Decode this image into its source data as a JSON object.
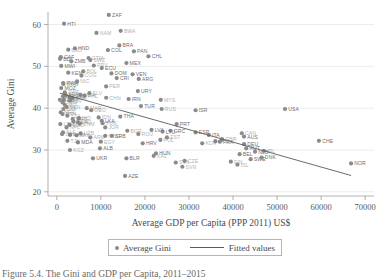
{
  "figure": {
    "caption": "Figure 5.4.   The Gini and GDP per Capita, 2011–2015"
  },
  "legend": {
    "marker_label": "Average Gini",
    "line_label": "Fitted values",
    "marker_icon": "filled-circle-marker",
    "line_icon": "solid-line-swatch"
  },
  "colors": {
    "marker": "#8b8b8b",
    "fit_line": "#5a5a5a",
    "gridline": "#d8d8d8",
    "axis": "#8f8f8f",
    "text": "#4a4a4a",
    "point_label": "#6f6f6f"
  },
  "chart_data": {
    "type": "scatter",
    "title": "",
    "xlabel": "Average GDP per Capita (PPP 2011) US$",
    "ylabel": "Average Gini",
    "xlim": [
      -2000,
      72000
    ],
    "ylim": [
      19,
      63
    ],
    "xticks": [
      0,
      10000,
      20000,
      30000,
      40000,
      50000,
      60000,
      70000
    ],
    "xticklabels": [
      "0",
      "10000",
      "20000",
      "30000",
      "40000",
      "50000",
      "60000",
      "70000"
    ],
    "yticks": [
      20,
      30,
      40,
      50,
      60
    ],
    "yticklabels": [
      "20",
      "30",
      "40",
      "50",
      "60"
    ],
    "grid": "horizontal",
    "legend_position": "below-axis",
    "series": [
      {
        "name": "Average Gini",
        "marker": "circle",
        "points": [
          {
            "label": "HTI",
            "x": 1650,
            "y": 60.2
          },
          {
            "label": "ZAF",
            "x": 11800,
            "y": 62.3
          },
          {
            "label": "BRA",
            "x": 14200,
            "y": 55.0
          },
          {
            "label": "HND",
            "x": 4100,
            "y": 54.3
          },
          {
            "label": "COL",
            "x": 11600,
            "y": 53.9
          },
          {
            "label": "PAN",
            "x": 17500,
            "y": 53.6
          },
          {
            "label": "CHL",
            "x": 20800,
            "y": 52.4
          },
          {
            "label": "CAF",
            "x": 900,
            "y": 52.2
          },
          {
            "label": "BDI",
            "x": 730,
            "y": 51.8
          },
          {
            "label": "ZMB",
            "x": 3300,
            "y": 51.2
          },
          {
            "label": "MEX",
            "x": 15800,
            "y": 50.8
          },
          {
            "label": "MWI",
            "x": 1000,
            "y": 50.1
          },
          {
            "label": "ECU",
            "x": 10200,
            "y": 49.6
          },
          {
            "label": "KEN",
            "x": 2600,
            "y": 48.5
          },
          {
            "label": "DOM",
            "x": 12400,
            "y": 48.3
          },
          {
            "label": "VEN",
            "x": 17200,
            "y": 48.1
          },
          {
            "label": "CRI",
            "x": 13600,
            "y": 47.2
          },
          {
            "label": "ARG",
            "x": 18600,
            "y": 47.0
          },
          {
            "label": "RWA",
            "x": 1450,
            "y": 46.0
          },
          {
            "label": "MOZ",
            "x": 1000,
            "y": 44.8
          },
          {
            "label": "URY",
            "x": 18400,
            "y": 44.1
          },
          {
            "label": "IRN",
            "x": 16300,
            "y": 42.2
          },
          {
            "label": "TUR",
            "x": 19100,
            "y": 40.5
          },
          {
            "label": "NGA",
            "x": 5400,
            "y": 43.2
          },
          {
            "label": "CHN",
            "x": 11200,
            "y": 42.5
          },
          {
            "label": "PHL",
            "x": 6300,
            "y": 43.0
          },
          {
            "label": "GHA",
            "x": 3500,
            "y": 42.4
          },
          {
            "label": "UGA",
            "x": 1600,
            "y": 42.0
          },
          {
            "label": "TGO",
            "x": 1300,
            "y": 41.4
          },
          {
            "label": "SEN",
            "x": 2200,
            "y": 40.3
          },
          {
            "label": "CIV",
            "x": 3000,
            "y": 41.8
          },
          {
            "label": "CMR",
            "x": 2900,
            "y": 42.6
          },
          {
            "label": "MLI",
            "x": 1800,
            "y": 40.8
          },
          {
            "label": "BFA",
            "x": 1500,
            "y": 39.8
          },
          {
            "label": "NER",
            "x": 900,
            "y": 39.0
          },
          {
            "label": "ETH",
            "x": 1300,
            "y": 38.6
          },
          {
            "label": "TZA",
            "x": 2400,
            "y": 38.2
          },
          {
            "label": "IND",
            "x": 5000,
            "y": 37.6
          },
          {
            "label": "LKA",
            "x": 10200,
            "y": 37.0
          },
          {
            "label": "VNM",
            "x": 5200,
            "y": 36.3
          },
          {
            "label": "IDN",
            "x": 9500,
            "y": 37.8
          },
          {
            "label": "BGD",
            "x": 2900,
            "y": 36.0
          },
          {
            "label": "NPL",
            "x": 2200,
            "y": 35.4
          },
          {
            "label": "PAK",
            "x": 4500,
            "y": 33.5
          },
          {
            "label": "EGY",
            "x": 10000,
            "y": 32.0
          },
          {
            "label": "UZB",
            "x": 5400,
            "y": 34.0
          },
          {
            "label": "MNG",
            "x": 11000,
            "y": 33.4
          },
          {
            "label": "THA",
            "x": 14400,
            "y": 38.0
          },
          {
            "label": "MYS",
            "x": 23600,
            "y": 42.0
          },
          {
            "label": "RUS",
            "x": 23800,
            "y": 39.8
          },
          {
            "label": "ISR",
            "x": 31500,
            "y": 39.5
          },
          {
            "label": "USA",
            "x": 51800,
            "y": 39.8
          },
          {
            "label": "PRT",
            "x": 27200,
            "y": 36.2
          },
          {
            "label": "GRC",
            "x": 25800,
            "y": 34.6
          },
          {
            "label": "ESP",
            "x": 31500,
            "y": 34.2
          },
          {
            "label": "ITA",
            "x": 34500,
            "y": 33.6
          },
          {
            "label": "AUS",
            "x": 42500,
            "y": 33.2
          },
          {
            "label": "GBR",
            "x": 37500,
            "y": 32.6
          },
          {
            "label": "FRA",
            "x": 37000,
            "y": 32.0
          },
          {
            "label": "DEU",
            "x": 42500,
            "y": 31.4
          },
          {
            "label": "AUT",
            "x": 43000,
            "y": 30.4
          },
          {
            "label": "NLD",
            "x": 45000,
            "y": 29.6
          },
          {
            "label": "BEL",
            "x": 41500,
            "y": 29.0
          },
          {
            "label": "IRL",
            "x": 47000,
            "y": 29.8
          },
          {
            "label": "SWE",
            "x": 44000,
            "y": 27.8
          },
          {
            "label": "DNK",
            "x": 46500,
            "y": 28.2
          },
          {
            "label": "CHE",
            "x": 59500,
            "y": 32.2
          },
          {
            "label": "NOR",
            "x": 66800,
            "y": 26.8
          },
          {
            "label": "POL",
            "x": 23500,
            "y": 32.4
          },
          {
            "label": "LTU",
            "x": 24000,
            "y": 34.4
          },
          {
            "label": "LVA",
            "x": 21500,
            "y": 34.8
          },
          {
            "label": "EST",
            "x": 25000,
            "y": 33.0
          },
          {
            "label": "CZE",
            "x": 29000,
            "y": 27.4
          },
          {
            "label": "SVK",
            "x": 27000,
            "y": 27.0
          },
          {
            "label": "SVN",
            "x": 28500,
            "y": 26.0
          },
          {
            "label": "HUN",
            "x": 22500,
            "y": 29.2
          },
          {
            "label": "ROU",
            "x": 18500,
            "y": 33.8
          },
          {
            "label": "BGR",
            "x": 16000,
            "y": 34.6
          },
          {
            "label": "SRB",
            "x": 12500,
            "y": 33.4
          },
          {
            "label": "HRV",
            "x": 19500,
            "y": 31.6
          },
          {
            "label": "ALB",
            "x": 9800,
            "y": 30.4
          },
          {
            "label": "UKR",
            "x": 8200,
            "y": 28.0
          },
          {
            "label": "BLR",
            "x": 15800,
            "y": 28.0
          },
          {
            "label": "AZE",
            "x": 15500,
            "y": 23.8
          },
          {
            "label": "MDA",
            "x": 4800,
            "y": 31.8
          },
          {
            "label": "ARM",
            "x": 7600,
            "y": 33.0
          },
          {
            "label": "GEO",
            "x": 7800,
            "y": 39.5
          },
          {
            "label": "KAZ",
            "x": 22000,
            "y": 28.6
          },
          {
            "label": "KGZ",
            "x": 3000,
            "y": 30.0
          },
          {
            "label": "TJK",
            "x": 2400,
            "y": 32.2
          },
          {
            "label": "MAR",
            "x": 6800,
            "y": 40.0
          },
          {
            "label": "TUN",
            "x": 10400,
            "y": 36.4
          },
          {
            "label": "JOR",
            "x": 11000,
            "y": 35.4
          },
          {
            "label": "KHM",
            "x": 3000,
            "y": 33.6
          },
          {
            "label": "LAO",
            "x": 4800,
            "y": 36.6
          },
          {
            "label": "BEN",
            "x": 1900,
            "y": 43.4
          },
          {
            "label": "GMB",
            "x": 1500,
            "y": 45.8
          },
          {
            "label": "NAM",
            "x": 9000,
            "y": 58.0
          },
          {
            "label": "BWA",
            "x": 14500,
            "y": 58.5
          },
          {
            "label": "LSO",
            "x": 2600,
            "y": 54.0
          },
          {
            "label": "SWZ",
            "x": 7600,
            "y": 51.5
          },
          {
            "label": "GTM",
            "x": 7200,
            "y": 52.0
          },
          {
            "label": "PRY",
            "x": 8400,
            "y": 50.2
          },
          {
            "label": "PER",
            "x": 11200,
            "y": 45.2
          },
          {
            "label": "SLV",
            "x": 7400,
            "y": 43.6
          },
          {
            "label": "NIC",
            "x": 4600,
            "y": 46.4
          },
          {
            "label": "BOL",
            "x": 6000,
            "y": 48.8
          },
          {
            "label": "COG",
            "x": 5600,
            "y": 47.8
          },
          {
            "label": "ZWE",
            "x": 1800,
            "y": 43.8
          },
          {
            "label": "MRT",
            "x": 3600,
            "y": 37.4
          },
          {
            "label": "SLE",
            "x": 1400,
            "y": 34.2
          },
          {
            "label": "LBR",
            "x": 800,
            "y": 36.2
          },
          {
            "label": "GIN",
            "x": 1200,
            "y": 33.8
          },
          {
            "label": "TCD",
            "x": 2000,
            "y": 43.0
          },
          {
            "label": "MDG",
            "x": 1400,
            "y": 42.8
          },
          {
            "label": "COD",
            "x": 700,
            "y": 42.0
          },
          {
            "label": "YEM",
            "x": 3800,
            "y": 36.8
          },
          {
            "label": "JPN",
            "x": 36000,
            "y": 32.1
          },
          {
            "label": "KOR",
            "x": 33000,
            "y": 31.6
          },
          {
            "label": "CAN",
            "x": 42000,
            "y": 34.0
          },
          {
            "label": "FIN",
            "x": 39500,
            "y": 27.2
          },
          {
            "label": "ISL",
            "x": 41000,
            "y": 26.5
          }
        ]
      }
    ],
    "fitted_line": {
      "name": "Fitted values",
      "x_start": 700,
      "y_start": 43.6,
      "x_end": 66800,
      "y_end": 23.9
    },
    "labeled_points": [
      "HTI",
      "ZAF",
      "BRA",
      "HND",
      "COL",
      "PAN",
      "CHL",
      "CAF",
      "BDI",
      "ZMB",
      "MEX",
      "MWI",
      "ECU",
      "KEN",
      "DOM",
      "VEN",
      "CRI",
      "ARG",
      "RWA",
      "MOZ",
      "URY",
      "IRN",
      "TUR",
      "ISR",
      "USA",
      "PRT",
      "GRC",
      "ESP",
      "ITA",
      "AUS",
      "FRA",
      "DEU",
      "AUT",
      "NLD",
      "BEL",
      "SWE",
      "DNK",
      "CHE",
      "NOR",
      "LTU",
      "LVA",
      "SRB",
      "MDA",
      "ALB",
      "UKR",
      "BLR",
      "HUN",
      "AZE",
      "LKA",
      "THA",
      "HRV"
    ]
  }
}
